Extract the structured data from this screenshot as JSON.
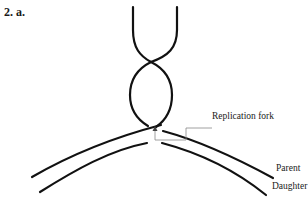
{
  "figure": {
    "title": "2. a.",
    "labels": {
      "replication_fork": "Replication fork",
      "parent": "Parent",
      "daughter": "Daughter"
    },
    "colors": {
      "strand": "#111111",
      "leader": "#888888",
      "background": "#ffffff"
    }
  }
}
